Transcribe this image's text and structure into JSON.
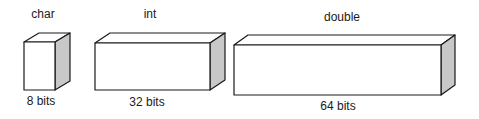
{
  "boxes": [
    {
      "type": "char",
      "size": "8 bits",
      "front": {
        "x": 24,
        "y": 42,
        "w": 31,
        "h": 48
      },
      "depth": {
        "dx": 15,
        "dy": -9
      },
      "type_label_pos": {
        "x": 43,
        "y": 7
      },
      "size_label_pos": {
        "x": 41,
        "y": 94
      }
    },
    {
      "type": "int",
      "size": "32 bits",
      "front": {
        "x": 95,
        "y": 43,
        "w": 115,
        "h": 47
      },
      "depth": {
        "dx": 15,
        "dy": -10
      },
      "type_label_pos": {
        "x": 150,
        "y": 7
      },
      "size_label_pos": {
        "x": 147,
        "y": 95
      }
    },
    {
      "type": "double",
      "size": "64 bits",
      "front": {
        "x": 234,
        "y": 45,
        "w": 207,
        "h": 50
      },
      "depth": {
        "dx": 14,
        "dy": -10
      },
      "type_label_pos": {
        "x": 342,
        "y": 10
      },
      "size_label_pos": {
        "x": 338,
        "y": 99
      }
    }
  ],
  "colors": {
    "stroke": "#1a1a1a",
    "front": "#ffffff",
    "top": "#ffffff",
    "side": "#c8c8c8"
  }
}
